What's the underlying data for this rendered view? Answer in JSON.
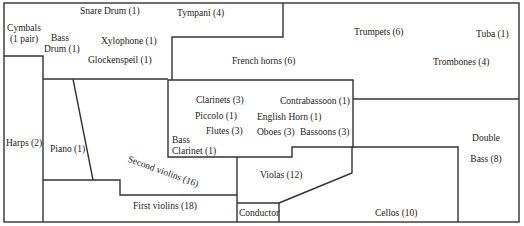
{
  "diagram": {
    "sections": {
      "cymbals": {
        "line1": "Cymbals",
        "line2": "(1 pair)"
      },
      "snare_drum": "Snare Drum (1)",
      "tympani": "Tympani (4)",
      "bass_drum": {
        "line1": "Bass",
        "line2": "Drum (1)"
      },
      "xylophone": "Xylophone (1)",
      "glockenspiel": "Glockenspeil (1)",
      "trumpets": "Trumpets (6)",
      "tuba": "Tuba (1)",
      "french_horns": "French horns (6)",
      "trombones": "Trombones (4)",
      "clarinets": "Clarinets (3)",
      "contrabassoon": "Contrabassoon (1)",
      "piccolo": "Piccolo (1)",
      "english_horn": "English Horn (1)",
      "flutes": "Flutes (3)",
      "oboes": "Oboes (3)",
      "bassoons": "Bassoons (3)",
      "bass_clarinet": {
        "line1": "Bass",
        "line2": "Clarinet (1)"
      },
      "harps": "Harps (2)",
      "piano": "Piano (1)",
      "second_violins": "Second violins (16)",
      "violas": "Violas (12)",
      "double_bass": {
        "line1": "Double",
        "line2": "Bass (8)"
      },
      "first_violins": "First violins (18)",
      "conductor": "Conductor",
      "cellos": "Cellos (10)"
    }
  }
}
